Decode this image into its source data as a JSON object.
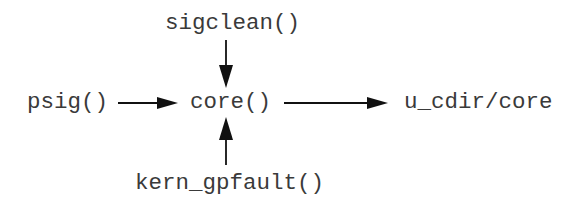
{
  "diagram": {
    "nodes": {
      "sigclean": {
        "label": "sigclean()"
      },
      "psig": {
        "label": "psig()"
      },
      "core": {
        "label": "core()"
      },
      "kern_gpfault": {
        "label": "kern_gpfault()"
      },
      "output": {
        "label": "u_cdir/core"
      }
    },
    "edges": [
      {
        "from": "sigclean()",
        "to": "core()",
        "direction": "down"
      },
      {
        "from": "psig()",
        "to": "core()",
        "direction": "right"
      },
      {
        "from": "kern_gpfault()",
        "to": "core()",
        "direction": "up"
      },
      {
        "from": "core()",
        "to": "u_cdir/core",
        "direction": "right"
      }
    ],
    "colors": {
      "text": "#3a3a3a",
      "arrow": "#111111",
      "background": "#ffffff"
    }
  }
}
